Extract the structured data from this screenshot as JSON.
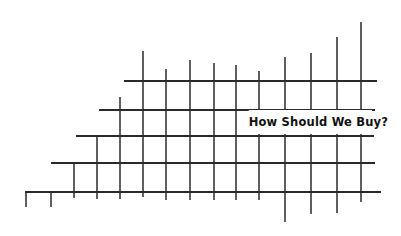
{
  "title": "How Should We Buy?",
  "colors": {
    "line": "#2a2a2a",
    "background": "#ffffff",
    "text": "#111111"
  },
  "grid": {
    "horizontal_lines": [
      {
        "y": 81,
        "x1": 124,
        "x2": 377
      },
      {
        "y": 110,
        "x1": 99,
        "x2": 375
      },
      {
        "y": 136,
        "x1": 76,
        "x2": 374
      },
      {
        "y": 163,
        "x1": 51,
        "x2": 375
      },
      {
        "y": 192,
        "x1": 25,
        "x2": 381
      }
    ],
    "vertical_lines": [
      {
        "x": 26,
        "y1": 192,
        "y2": 207
      },
      {
        "x": 51,
        "y1": 192,
        "y2": 207
      },
      {
        "x": 74,
        "y1": 163,
        "y2": 198
      },
      {
        "x": 97,
        "y1": 136,
        "y2": 199
      },
      {
        "x": 120,
        "y1": 97,
        "y2": 199
      },
      {
        "x": 143,
        "y1": 51,
        "y2": 197
      },
      {
        "x": 166,
        "y1": 69,
        "y2": 200
      },
      {
        "x": 190,
        "y1": 60,
        "y2": 200
      },
      {
        "x": 214,
        "y1": 63,
        "y2": 200
      },
      {
        "x": 236,
        "y1": 65,
        "y2": 200
      },
      {
        "x": 259,
        "y1": 71,
        "y2": 200
      },
      {
        "x": 285,
        "y1": 57,
        "y2": 222
      },
      {
        "x": 311,
        "y1": 53,
        "y2": 214
      },
      {
        "x": 337,
        "y1": 37,
        "y2": 213
      },
      {
        "x": 361,
        "y1": 22,
        "y2": 202
      }
    ]
  }
}
